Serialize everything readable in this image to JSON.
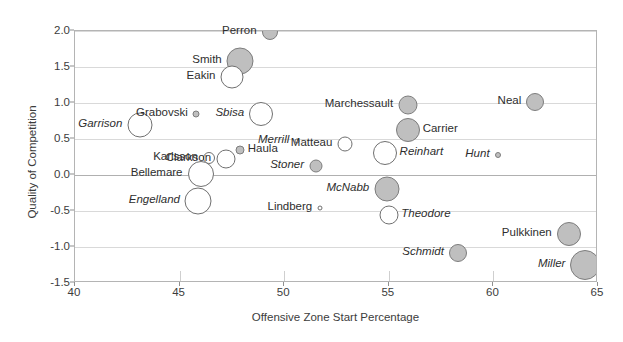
{
  "chart_data": {
    "type": "scatter",
    "title": "",
    "xlabel": "Offensive Zone Start Percentage",
    "ylabel": "Quality of Competition",
    "xlim": [
      40,
      65
    ],
    "ylim": [
      -1.5,
      2.0
    ],
    "xticks": [
      "40",
      "45",
      "50",
      "55",
      "60",
      "65"
    ],
    "xtick_values": [
      40,
      45,
      50,
      55,
      60,
      65
    ],
    "yticks": [
      "2.0",
      "1.5",
      "1.0",
      "0.5",
      "0.0",
      "-0.5",
      "-1.0",
      "-1.5"
    ],
    "ytick_values": [
      2.0,
      1.5,
      1.0,
      0.5,
      0.0,
      -0.5,
      -1.0,
      -1.5
    ],
    "grid": true,
    "legend": "none",
    "size_encodes": "bubble-size",
    "fill_styles": {
      "filled": "#bfbfbf",
      "open": "#ffffff",
      "stroke": "#7d7d7d"
    },
    "points": [
      {
        "name": "Perron",
        "x": 49.3,
        "y": 1.98,
        "r": 8.0,
        "fill": "filled",
        "italic": false,
        "label_side": "left"
      },
      {
        "name": "Smith",
        "x": 47.9,
        "y": 1.58,
        "r": 13.5,
        "fill": "filled",
        "italic": false,
        "label_side": "left"
      },
      {
        "name": "Eakin",
        "x": 47.5,
        "y": 1.36,
        "r": 11.5,
        "fill": "open",
        "italic": false,
        "label_side": "left"
      },
      {
        "name": "Grabovski",
        "x": 45.8,
        "y": 0.85,
        "r": 3.5,
        "fill": "filled",
        "italic": false,
        "label_side": "left"
      },
      {
        "name": "Sbisa",
        "x": 48.9,
        "y": 0.85,
        "r": 12.0,
        "fill": "open",
        "italic": true,
        "label_side": "left"
      },
      {
        "name": "Garrison",
        "x": 43.1,
        "y": 0.7,
        "r": 12.5,
        "fill": "open",
        "italic": true,
        "label_side": "left"
      },
      {
        "name": "Neal",
        "x": 62.0,
        "y": 1.02,
        "r": 9.0,
        "fill": "filled",
        "italic": false,
        "label_side": "left"
      },
      {
        "name": "Marchessault",
        "x": 55.9,
        "y": 0.97,
        "r": 9.5,
        "fill": "filled",
        "italic": false,
        "label_side": "left"
      },
      {
        "name": "Carrier",
        "x": 55.9,
        "y": 0.62,
        "r": 12.0,
        "fill": "filled",
        "italic": false,
        "label_side": "right"
      },
      {
        "name": "Matteau",
        "x": 52.9,
        "y": 0.43,
        "r": 7.5,
        "fill": "open",
        "italic": false,
        "label_side": "left"
      },
      {
        "name": "Reinhart",
        "x": 54.8,
        "y": 0.3,
        "r": 12.0,
        "fill": "open",
        "italic": true,
        "label_side": "right"
      },
      {
        "name": "Merrill",
        "x": 50.6,
        "y": 0.47,
        "r": 2.5,
        "fill": "open",
        "italic": true,
        "label_side": "left"
      },
      {
        "name": "Haula",
        "x": 47.9,
        "y": 0.35,
        "r": 4.5,
        "fill": "filled",
        "italic": false,
        "label_side": "right"
      },
      {
        "name": "Hunt",
        "x": 60.2,
        "y": 0.28,
        "r": 3.0,
        "fill": "filled",
        "italic": true,
        "label_side": "left"
      },
      {
        "name": "Clarkson",
        "x": 47.2,
        "y": 0.22,
        "r": 9.5,
        "fill": "open",
        "italic": false,
        "label_side": "left"
      },
      {
        "name": "Karlsson",
        "x": 46.4,
        "y": 0.23,
        "r": 6.0,
        "fill": "open",
        "italic": false,
        "label_side": "left"
      },
      {
        "name": "Stoner",
        "x": 51.5,
        "y": 0.13,
        "r": 6.5,
        "fill": "filled",
        "italic": true,
        "label_side": "left"
      },
      {
        "name": "Bellemare",
        "x": 46.0,
        "y": 0.01,
        "r": 13.0,
        "fill": "open",
        "italic": false,
        "label_side": "left"
      },
      {
        "name": "McNabb",
        "x": 54.9,
        "y": -0.2,
        "r": 12.5,
        "fill": "filled",
        "italic": true,
        "label_side": "left"
      },
      {
        "name": "Engelland",
        "x": 45.9,
        "y": -0.36,
        "r": 13.5,
        "fill": "open",
        "italic": true,
        "label_side": "left"
      },
      {
        "name": "Lindberg",
        "x": 51.7,
        "y": -0.46,
        "r": 2.5,
        "fill": "open",
        "italic": false,
        "label_side": "left"
      },
      {
        "name": "Theodore",
        "x": 55.0,
        "y": -0.56,
        "r": 9.5,
        "fill": "open",
        "italic": true,
        "label_side": "right"
      },
      {
        "name": "Pulkkinen",
        "x": 63.6,
        "y": -0.82,
        "r": 12.0,
        "fill": "filled",
        "italic": false,
        "label_side": "left"
      },
      {
        "name": "Schmidt",
        "x": 58.3,
        "y": -1.08,
        "r": 9.0,
        "fill": "filled",
        "italic": true,
        "label_side": "left"
      },
      {
        "name": "Miller",
        "x": 64.4,
        "y": -1.25,
        "r": 15.0,
        "fill": "filled",
        "italic": true,
        "label_side": "left"
      }
    ]
  }
}
